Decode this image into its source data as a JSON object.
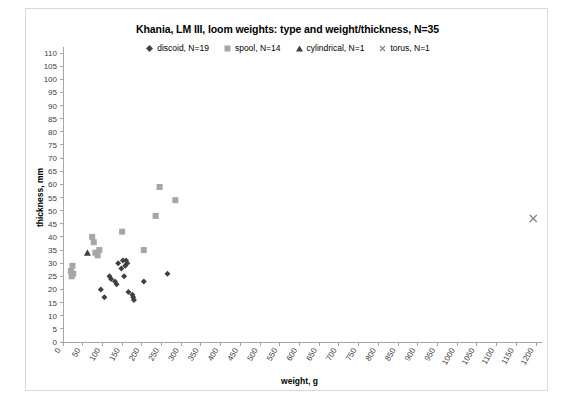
{
  "chart_data": {
    "type": "scatter",
    "title": "Khania, LM III, loom weights: type and weight/thickness, N=35",
    "xlabel": "weight, g",
    "ylabel": "thickness, mm",
    "xlim": [
      0,
      1200
    ],
    "ylim": [
      0,
      110
    ],
    "xticks": [
      0,
      50,
      100,
      150,
      200,
      250,
      300,
      350,
      400,
      450,
      500,
      550,
      600,
      650,
      700,
      750,
      800,
      850,
      900,
      950,
      1000,
      1050,
      1100,
      1150,
      1200
    ],
    "yticks": [
      0,
      5,
      10,
      15,
      20,
      25,
      30,
      35,
      40,
      45,
      50,
      55,
      60,
      65,
      70,
      75,
      80,
      85,
      90,
      95,
      100,
      105,
      110
    ],
    "grid": false,
    "legend_position": "top",
    "marker_color": "#595959",
    "spool_color": "#a6a6a6",
    "series": [
      {
        "name": "discoid, N=19",
        "marker": "diamond",
        "color": "#404040",
        "points": [
          [
            96,
            20
          ],
          [
            105,
            17
          ],
          [
            118,
            25
          ],
          [
            122,
            24
          ],
          [
            132,
            23
          ],
          [
            136,
            22
          ],
          [
            140,
            30
          ],
          [
            148,
            28
          ],
          [
            152,
            31
          ],
          [
            155,
            25
          ],
          [
            158,
            29
          ],
          [
            160,
            31
          ],
          [
            163,
            30
          ],
          [
            166,
            19
          ],
          [
            176,
            18
          ],
          [
            178,
            17
          ],
          [
            180,
            16
          ],
          [
            205,
            23
          ],
          [
            265,
            26
          ]
        ]
      },
      {
        "name": "spool, N=14",
        "marker": "square",
        "color": "#a6a6a6",
        "points": [
          [
            20,
            27
          ],
          [
            22,
            25
          ],
          [
            24,
            29
          ],
          [
            26,
            26
          ],
          [
            74,
            40
          ],
          [
            78,
            38
          ],
          [
            82,
            34
          ],
          [
            88,
            33
          ],
          [
            92,
            35
          ],
          [
            150,
            42
          ],
          [
            205,
            35
          ],
          [
            235,
            48
          ],
          [
            245,
            59
          ],
          [
            285,
            54
          ]
        ]
      },
      {
        "name": "cylindrical, N=1",
        "marker": "triangle",
        "color": "#404040",
        "points": [
          [
            62,
            34
          ]
        ]
      },
      {
        "name": "torus, N=1",
        "marker": "cross",
        "color": "#808080",
        "points": [
          [
            1193,
            47
          ]
        ]
      }
    ]
  }
}
